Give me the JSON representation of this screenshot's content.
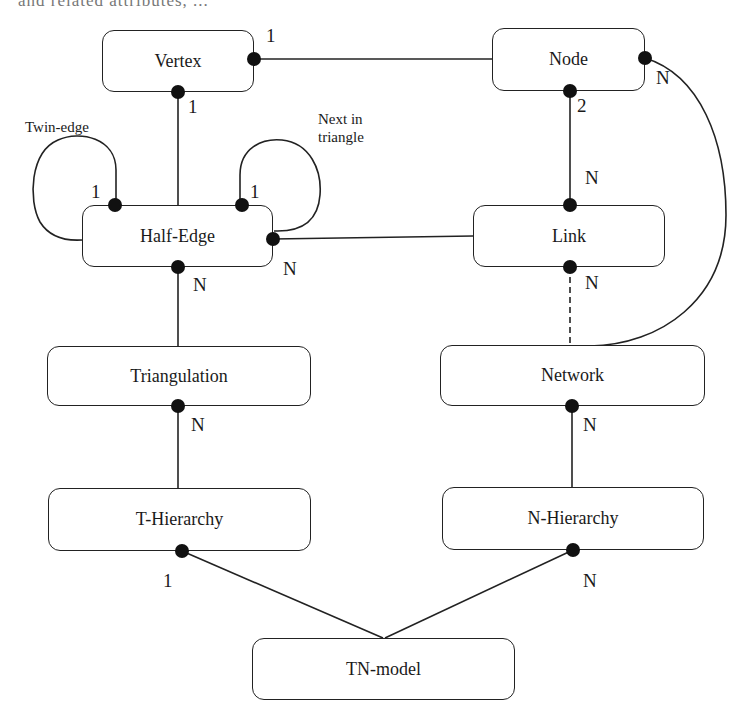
{
  "page": {
    "partial_top_text": "and   related   attributes,   ..."
  },
  "diagram": {
    "entities": [
      {
        "id": "vertex",
        "label": "Vertex",
        "x": 102,
        "y": 30,
        "w": 152,
        "h": 62
      },
      {
        "id": "node",
        "label": "Node",
        "x": 492,
        "y": 28,
        "w": 153,
        "h": 63
      },
      {
        "id": "half-edge",
        "label": "Half-Edge",
        "x": 82,
        "y": 205,
        "w": 191,
        "h": 62
      },
      {
        "id": "link",
        "label": "Link",
        "x": 473,
        "y": 205,
        "w": 192,
        "h": 62
      },
      {
        "id": "triangulation",
        "label": "Triangulation",
        "x": 47,
        "y": 346,
        "w": 264,
        "h": 60
      },
      {
        "id": "network",
        "label": "Network",
        "x": 440,
        "y": 345,
        "w": 265,
        "h": 61
      },
      {
        "id": "t-hierarchy",
        "label": "T-Hierarchy",
        "x": 48,
        "y": 488,
        "w": 263,
        "h": 63
      },
      {
        "id": "n-hierarchy",
        "label": "N-Hierarchy",
        "x": 442,
        "y": 487,
        "w": 262,
        "h": 63
      },
      {
        "id": "tn-model",
        "label": "TN-model",
        "x": 252,
        "y": 638,
        "w": 263,
        "h": 62
      }
    ],
    "relationships": [
      {
        "from": "vertex",
        "to": "node",
        "from_card": "1",
        "to_card": "",
        "style": "solid"
      },
      {
        "from": "vertex",
        "to": "half-edge",
        "from_card": "1",
        "to_card": "",
        "style": "solid"
      },
      {
        "from": "half-edge",
        "to": "half-edge",
        "label": "Twin-edge",
        "card": "1",
        "style": "self-loop"
      },
      {
        "from": "half-edge",
        "to": "half-edge",
        "label": "Next in triangle",
        "card": "1",
        "style": "self-loop"
      },
      {
        "from": "half-edge",
        "to": "link",
        "from_card": "N",
        "to_card": "",
        "style": "solid"
      },
      {
        "from": "node",
        "to": "link",
        "from_card": "2",
        "to_card": "N",
        "style": "solid"
      },
      {
        "from": "node",
        "to": "network",
        "from_card": "N",
        "to_card": "",
        "style": "curved"
      },
      {
        "from": "link",
        "to": "network",
        "from_card": "N",
        "to_card": "",
        "style": "dashed"
      },
      {
        "from": "half-edge",
        "to": "triangulation",
        "from_card": "N",
        "to_card": "",
        "style": "solid"
      },
      {
        "from": "triangulation",
        "to": "t-hierarchy",
        "from_card": "N",
        "to_card": "",
        "style": "solid"
      },
      {
        "from": "network",
        "to": "n-hierarchy",
        "from_card": "N",
        "to_card": "",
        "style": "solid"
      },
      {
        "from": "t-hierarchy",
        "to": "tn-model",
        "from_card": "1",
        "to_card": "",
        "style": "solid"
      },
      {
        "from": "n-hierarchy",
        "to": "tn-model",
        "from_card": "N",
        "to_card": "",
        "style": "solid"
      }
    ],
    "cardinality_labels": {
      "vertex_right": "1",
      "vertex_bottom": "1",
      "twin_edge": "1",
      "next_in_triangle": "1",
      "half_edge_right": "N",
      "half_edge_bottom": "N",
      "node_right": "N",
      "node_bottom": "2",
      "link_top": "N",
      "link_bottom": "N",
      "triangulation_bottom": "N",
      "network_bottom": "N",
      "t_hierarchy_bottom": "1",
      "n_hierarchy_bottom": "N"
    },
    "relationship_labels": {
      "twin_edge": "Twin-edge",
      "next_in_triangle_line1": "Next in",
      "next_in_triangle_line2": "triangle"
    },
    "colors": {
      "line": "#222222",
      "dot": "#111111",
      "background": "#ffffff"
    }
  }
}
